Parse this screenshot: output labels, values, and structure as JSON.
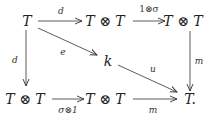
{
  "diagram": {
    "type": "commutative-diagram",
    "nodes": {
      "top_left": {
        "label": "T",
        "x": 27,
        "y": 21
      },
      "top_mid": {
        "label": "T ⊗ T",
        "x": 105,
        "y": 21
      },
      "top_right": {
        "label": "T ⊗ T",
        "x": 183,
        "y": 21
      },
      "center": {
        "label": "k",
        "x": 108,
        "y": 61
      },
      "bottom_left": {
        "label": "T ⊗ T",
        "x": 25,
        "y": 99
      },
      "bottom_mid": {
        "label": "T ⊗ T",
        "x": 105,
        "y": 99
      },
      "bottom_right": {
        "label": "T.",
        "x": 189,
        "y": 99
      }
    },
    "arrows": {
      "top_d": {
        "label": "d",
        "from": "top_left",
        "to": "top_mid"
      },
      "top_one_sigma": {
        "label": "1⊗σ",
        "from": "top_mid",
        "to": "top_right"
      },
      "left_d": {
        "label": "d",
        "from": "top_left",
        "to": "bottom_left"
      },
      "right_m": {
        "label": "m",
        "from": "top_right",
        "to": "bottom_right"
      },
      "diag_e": {
        "label": "e",
        "from": "top_left",
        "to": "center"
      },
      "diag_u": {
        "label": "u",
        "from": "center",
        "to": "bottom_right"
      },
      "bottom_sigma_one": {
        "label": "σ⊗1",
        "from": "bottom_left",
        "to": "bottom_mid"
      },
      "bottom_m": {
        "label": "m",
        "from": "bottom_mid",
        "to": "bottom_right"
      }
    },
    "colors": {
      "ink": "#222222",
      "background": "#ffffff"
    }
  }
}
